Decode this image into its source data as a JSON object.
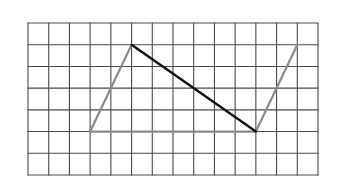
{
  "diagram": {
    "type": "grid-figure",
    "grid": {
      "columns": 14,
      "rows": 7,
      "origin_px": [
        28,
        23
      ],
      "extent_px": [
        318,
        175
      ],
      "line_color": "#4a4a4a",
      "line_width": 1.1
    },
    "shape": {
      "name": "parallelogram",
      "vertices": {
        "A": {
          "col": 3,
          "row": 5
        },
        "B": {
          "col": 5,
          "row": 1
        },
        "C": {
          "col": 13,
          "row": 1
        },
        "D": {
          "col": 11,
          "row": 5
        }
      },
      "sides": [
        {
          "from": "A",
          "to": "B",
          "color": "#8a8a8a",
          "width": 2.2
        },
        {
          "from": "A",
          "to": "D",
          "color": "#8a8a8a",
          "width": 2.2
        },
        {
          "from": "D",
          "to": "C",
          "color": "#8a8a8a",
          "width": 2.2
        }
      ],
      "diagonal": {
        "from": "B",
        "to": "D",
        "color": "#111111",
        "width": 2.4
      }
    }
  }
}
